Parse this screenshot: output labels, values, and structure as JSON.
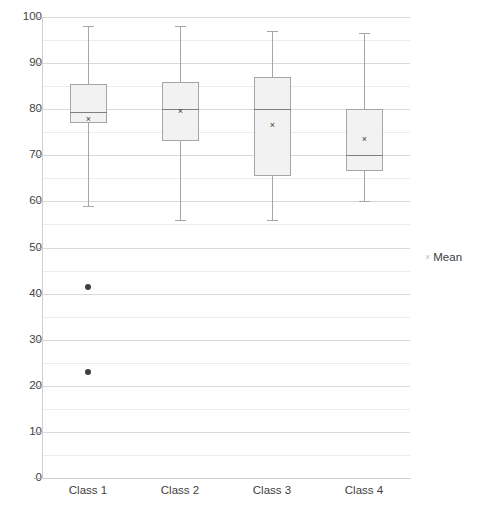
{
  "chart_data": {
    "type": "box",
    "title": "",
    "xlabel": "",
    "ylabel": "",
    "categories": [
      "Class 1",
      "Class 2",
      "Class 3",
      "Class 4"
    ],
    "ylim": [
      0,
      100
    ],
    "ytick_step": 10,
    "yminor_step": 5,
    "grid": true,
    "legend_position": "right",
    "legend": [
      {
        "label": "Mean",
        "marker": "×",
        "color": "#bfbfbf"
      }
    ],
    "colors": {
      "box_fill": "#f2f2f2",
      "box_border": "#a6a6a6",
      "median": "#808080",
      "whisker": "#a6a6a6",
      "mean_marker": "#3f3f3f",
      "outlier": "#3f3f3f",
      "gridline": "#d9d9d9",
      "gridline_minor": "#ececec",
      "axis": "#d0d0d0",
      "text": "#404040"
    },
    "ytick_labels": [
      "100",
      "90",
      "80",
      "70",
      "60",
      "50",
      "40",
      "30",
      "20",
      "10",
      "0"
    ],
    "ytick_values": [
      100,
      90,
      80,
      70,
      60,
      50,
      40,
      30,
      20,
      10,
      0
    ],
    "yminor_values": [
      95,
      85,
      75,
      65,
      55,
      45,
      35,
      25,
      15,
      5
    ],
    "boxes": [
      {
        "category": "Class 1",
        "whisker_low": 59.0,
        "q1": 77.0,
        "median": 79.5,
        "q3": 85.5,
        "whisker_high": 98.0,
        "mean": 77.8,
        "outliers": [
          41.5,
          23.0
        ]
      },
      {
        "category": "Class 2",
        "whisker_low": 56.0,
        "q1": 73.0,
        "median": 80.0,
        "q3": 86.0,
        "whisker_high": 98.0,
        "mean": 79.4,
        "outliers": []
      },
      {
        "category": "Class 3",
        "whisker_low": 56.0,
        "q1": 65.5,
        "median": 80.0,
        "q3": 87.0,
        "whisker_high": 97.0,
        "mean": 76.5,
        "outliers": []
      },
      {
        "category": "Class 4",
        "whisker_low": 60.0,
        "q1": 66.5,
        "median": 70.0,
        "q3": 80.0,
        "whisker_high": 96.5,
        "mean": 73.5,
        "outliers": []
      }
    ]
  },
  "layout": {
    "plot_left": 42,
    "plot_top": 17,
    "plot_width": 368,
    "plot_height": 461,
    "box_width": 37
  }
}
